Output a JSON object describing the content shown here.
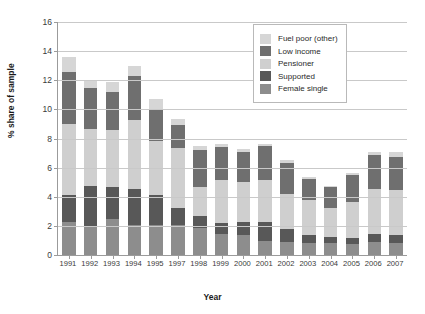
{
  "chart_data": {
    "type": "bar",
    "subtype": "stacked-vertical",
    "title": "",
    "xlabel": "Year",
    "ylabel": "% share of sample",
    "ylim": [
      0,
      16
    ],
    "ytick_step": 2,
    "yticks": [
      "0",
      "2",
      "4",
      "6",
      "8",
      "10",
      "12",
      "14",
      "16"
    ],
    "grid": "horizontal",
    "legend_position": "top-right-inside",
    "categories": [
      "1991",
      "1992",
      "1993",
      "1994",
      "1995",
      "1997",
      "1998",
      "1999",
      "2000",
      "2001",
      "2002",
      "2003",
      "2004",
      "2005",
      "2006",
      "2007"
    ],
    "series": [
      {
        "name": "Female single",
        "color": "#8d8d8d",
        "values": [
          2.3,
          1.9,
          2.5,
          2.05,
          2.05,
          2.05,
          1.85,
          1.45,
          1.35,
          0.95,
          0.9,
          0.85,
          0.8,
          0.75,
          0.9,
          0.85
        ]
      },
      {
        "name": "Supported",
        "color": "#585858",
        "values": [
          1.8,
          2.85,
          2.15,
          2.45,
          2.05,
          1.2,
          0.8,
          0.75,
          0.9,
          1.35,
          0.9,
          0.55,
          0.45,
          0.45,
          0.55,
          0.5
        ]
      },
      {
        "name": "Pensioner",
        "color": "#cfcfcf",
        "values": [
          4.9,
          3.9,
          3.95,
          4.8,
          3.75,
          4.1,
          2.0,
          2.95,
          2.75,
          2.85,
          2.4,
          2.35,
          2.0,
          2.45,
          3.05,
          3.1
        ]
      },
      {
        "name": "Low income",
        "color": "#6f6f6f",
        "values": [
          3.6,
          2.8,
          2.6,
          3.0,
          2.15,
          1.6,
          2.55,
          2.3,
          2.1,
          2.35,
          2.1,
          1.45,
          1.4,
          1.85,
          2.35,
          2.3
        ]
      },
      {
        "name": "Fuel poor (other)",
        "color": "#d6d6d6",
        "values": [
          1.0,
          0.5,
          0.65,
          0.65,
          0.7,
          0.4,
          0.3,
          0.15,
          0.2,
          0.15,
          0.2,
          0.15,
          0.1,
          0.15,
          0.25,
          0.35
        ]
      }
    ],
    "stack_order_bottom_to_top": [
      "Female single",
      "Supported",
      "Pensioner",
      "Low income",
      "Fuel poor (other)"
    ],
    "totals": [
      13.6,
      11.95,
      11.85,
      12.95,
      10.7,
      9.35,
      7.5,
      7.6,
      7.3,
      7.65,
      6.5,
      5.35,
      4.75,
      5.65,
      7.1,
      7.1
    ]
  },
  "legend": {
    "entries": [
      {
        "label": "Fuel poor (other)",
        "color": "#d6d6d6"
      },
      {
        "label": "Low income",
        "color": "#6f6f6f"
      },
      {
        "label": "Pensioner",
        "color": "#cfcfcf"
      },
      {
        "label": "Supported",
        "color": "#585858"
      },
      {
        "label": "Female single",
        "color": "#8d8d8d"
      }
    ]
  },
  "axes": {
    "y_title": "% share of sample",
    "x_title": "Year"
  },
  "colors": {
    "gridline": "#c9c9c9",
    "axis": "#9b9b9b",
    "background": "#ffffff",
    "text": "#3a3a3a"
  }
}
